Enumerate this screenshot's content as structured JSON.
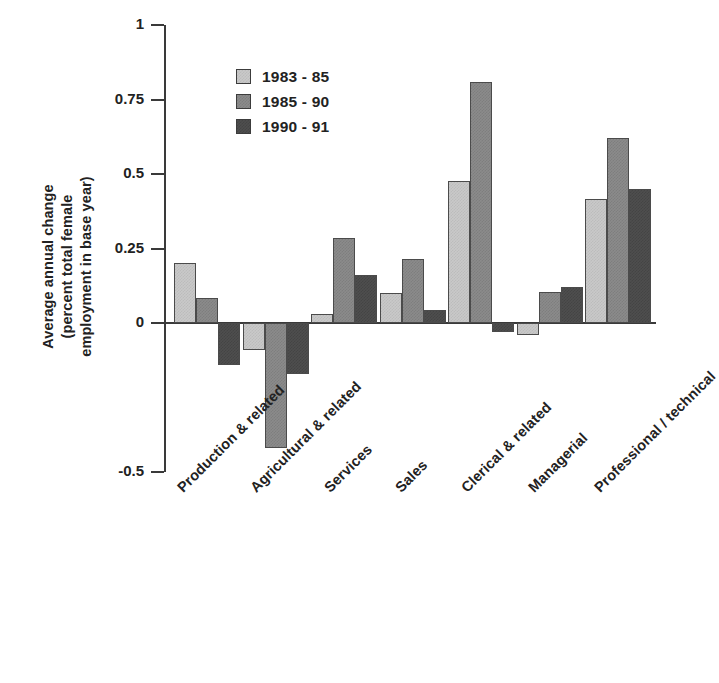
{
  "chart_data": {
    "type": "bar",
    "title": "",
    "xlabel": "",
    "ylabel": "Average annual change (percent total female employment in base year)",
    "ylabel_lines": [
      "Average annual change",
      "(percent total female",
      "employment in base year)"
    ],
    "ylim": [
      -0.5,
      1
    ],
    "yticks": [
      1,
      0.75,
      0.5,
      0.25,
      0,
      -0.5
    ],
    "ytick_labels": [
      "1",
      "0.75",
      "0.5",
      "0.25",
      "0",
      "-0.5"
    ],
    "grid": false,
    "legend_position": "upper-left-inside",
    "categories": [
      "Production & related",
      "Agricultural & related",
      "Services",
      "Sales",
      "Clerical & related",
      "Managerial",
      "Professional / technical"
    ],
    "series": [
      {
        "name": "1983 - 85",
        "color": "#c9c9c9",
        "values": [
          0.2,
          -0.09,
          0.03,
          0.1,
          0.475,
          -0.04,
          0.415
        ]
      },
      {
        "name": "1985 - 90",
        "color": "#8b8b8b",
        "values": [
          0.085,
          -0.42,
          0.285,
          0.215,
          0.81,
          0.105,
          0.62
        ]
      },
      {
        "name": "1990 - 91",
        "color": "#4e4e4e",
        "values": [
          -0.14,
          -0.17,
          0.16,
          0.045,
          -0.03,
          0.12,
          0.45
        ]
      }
    ]
  },
  "legend": {
    "items": [
      {
        "label": "1983 - 85",
        "swatch": "#c9c9c9"
      },
      {
        "label": "1985 - 90",
        "swatch": "#8b8b8b"
      },
      {
        "label": "1990 - 91",
        "swatch": "#4e4e4e"
      }
    ]
  }
}
